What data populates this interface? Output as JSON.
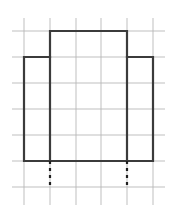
{
  "figure": {
    "canvas": {
      "width": 177,
      "height": 214,
      "background": "#ffffff"
    },
    "grid": {
      "label": "graph-paper-grid",
      "color": "#b8b8b8",
      "stroke_width": 0.9,
      "spacing_px": 26,
      "vertical_lines_x": [
        24,
        50,
        76,
        101,
        127,
        153
      ],
      "vertical_extent_y": [
        18,
        205
      ],
      "horizontal_lines_y": [
        31,
        57,
        83,
        109,
        135,
        161,
        187
      ],
      "horizontal_extent_x": [
        12,
        165
      ]
    },
    "shape": {
      "label": "cross-polygon-outline",
      "color": "#3b3b3b",
      "stroke_width": 2.2,
      "fill": "none",
      "outline_points": "50,31 127,31 127,57 153,57 153,161 24,161 24,57 50,57 50,31",
      "interior_lines": [
        {
          "name": "interior-vertical-left",
          "x1": 50,
          "y1": 57,
          "x2": 50,
          "y2": 161
        },
        {
          "name": "interior-vertical-right",
          "x1": 127,
          "y1": 57,
          "x2": 127,
          "y2": 161
        }
      ],
      "vertices": [
        {
          "name": "top-left",
          "x": 50,
          "y": 31
        },
        {
          "name": "top-right",
          "x": 127,
          "y": 31
        },
        {
          "name": "shoulder-right",
          "x": 127,
          "y": 57
        },
        {
          "name": "outer-top-right",
          "x": 153,
          "y": 57
        },
        {
          "name": "bottom-right",
          "x": 153,
          "y": 161
        },
        {
          "name": "bottom-left",
          "x": 24,
          "y": 161
        },
        {
          "name": "outer-top-left",
          "x": 24,
          "y": 57
        },
        {
          "name": "shoulder-left",
          "x": 50,
          "y": 57
        }
      ]
    },
    "dashed_guides": {
      "label": "dashed-extension-lines",
      "color": "#1f1f1f",
      "stroke_width": 2.2,
      "dash_pattern": "3 4",
      "lines": [
        {
          "name": "dashed-guide-left",
          "x1": 50,
          "y1": 161,
          "x2": 50,
          "y2": 188
        },
        {
          "name": "dashed-guide-right",
          "x1": 127,
          "y1": 161,
          "x2": 127,
          "y2": 188
        }
      ]
    }
  }
}
